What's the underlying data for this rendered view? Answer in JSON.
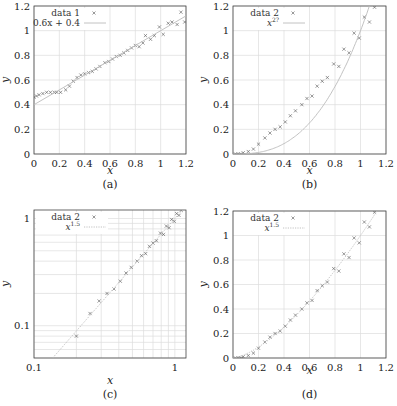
{
  "chart_data": [
    {
      "id": "a",
      "type": "scatter",
      "caption": "(a)",
      "xlabel": "x",
      "ylabel": "y",
      "xlim": [
        0,
        1.2
      ],
      "ylim": [
        0,
        1.2
      ],
      "xticks": [
        "0",
        "0.2",
        "0.4",
        "0.6",
        "0.8",
        "1",
        "1.2"
      ],
      "yticks": [
        "0",
        "0.2",
        "0.4",
        "0.6",
        "0.8",
        "1",
        "1.2"
      ],
      "grid": true,
      "legend_position": "upper left",
      "series": [
        {
          "name": "data 1",
          "marker": "x",
          "x": [
            0,
            0.02,
            0.04,
            0.07,
            0.1,
            0.13,
            0.16,
            0.18,
            0.21,
            0.25,
            0.28,
            0.31,
            0.34,
            0.37,
            0.4,
            0.43,
            0.46,
            0.49,
            0.52,
            0.56,
            0.59,
            0.62,
            0.65,
            0.68,
            0.71,
            0.74,
            0.77,
            0.8,
            0.83,
            0.86,
            0.88,
            0.92,
            0.95,
            0.99,
            1.02,
            1.06,
            1.09,
            1.13,
            1.16,
            1.19
          ],
          "y": [
            0.46,
            0.47,
            0.48,
            0.49,
            0.5,
            0.5,
            0.5,
            0.5,
            0.5,
            0.52,
            0.55,
            0.59,
            0.62,
            0.64,
            0.65,
            0.66,
            0.67,
            0.69,
            0.71,
            0.74,
            0.75,
            0.77,
            0.79,
            0.8,
            0.82,
            0.84,
            0.86,
            0.88,
            0.87,
            0.9,
            0.96,
            0.93,
            0.96,
            1.03,
            0.97,
            1.06,
            1.07,
            1.05,
            1.15,
            1.07
          ]
        },
        {
          "name": "0.6x + 0.4",
          "type": "line",
          "style": "solid",
          "x": [
            0,
            1.2
          ],
          "y": [
            0.4,
            1.12
          ]
        }
      ]
    },
    {
      "id": "b",
      "type": "scatter",
      "caption": "(b)",
      "xlabel": "x",
      "ylabel": "y",
      "xlim": [
        0,
        1.2
      ],
      "ylim": [
        0,
        1.2
      ],
      "xticks": [
        "0",
        "0.2",
        "0.4",
        "0.6",
        "0.8",
        "1",
        "1.2"
      ],
      "yticks": [
        "0",
        "0.2",
        "0.4",
        "0.6",
        "0.8",
        "1",
        "1.2"
      ],
      "grid": true,
      "legend_position": "upper left",
      "series": [
        {
          "name": "data 2",
          "marker": "x",
          "x": [
            0.02,
            0.04,
            0.06,
            0.08,
            0.12,
            0.16,
            0.2,
            0.25,
            0.29,
            0.33,
            0.37,
            0.41,
            0.45,
            0.49,
            0.54,
            0.58,
            0.62,
            0.66,
            0.7,
            0.74,
            0.79,
            0.83,
            0.87,
            0.91,
            0.95,
            0.99,
            1.03,
            1.07,
            1.11
          ],
          "y": [
            0,
            0,
            0,
            0.01,
            0.02,
            0.04,
            0.08,
            0.13,
            0.17,
            0.2,
            0.22,
            0.26,
            0.31,
            0.35,
            0.4,
            0.45,
            0.47,
            0.55,
            0.59,
            0.62,
            0.73,
            0.71,
            0.85,
            0.82,
            0.98,
            0.94,
            1.11,
            1.07,
            1.19
          ]
        },
        {
          "name": "x^2?",
          "type": "line",
          "style": "solid",
          "exponent": 2.7
        }
      ]
    },
    {
      "id": "c",
      "type": "scatter",
      "caption": "(c)",
      "xlabel": "x",
      "ylabel": "y",
      "xscale": "log",
      "yscale": "log",
      "xlim": [
        0.1,
        1.2
      ],
      "ylim": [
        0.05,
        1.2
      ],
      "xticks": [
        "0.1",
        "1"
      ],
      "yticks": [
        "0.1",
        "1"
      ],
      "grid": true,
      "legend_position": "upper left",
      "series": [
        {
          "name": "data 2",
          "marker": "x",
          "ref": "b"
        },
        {
          "name": "x^1.5",
          "type": "line",
          "style": "dotted",
          "exponent": 1.5
        }
      ]
    },
    {
      "id": "d",
      "type": "scatter",
      "caption": "(d)",
      "xlabel": "x",
      "ylabel": "y",
      "xlim": [
        0,
        1.2
      ],
      "ylim": [
        0,
        1.2
      ],
      "xticks": [
        "0",
        "0.2",
        "0.4",
        "0.6",
        "0.8",
        "1",
        "1.2"
      ],
      "yticks": [
        "0",
        "0.2",
        "0.4",
        "0.6",
        "0.8",
        "1",
        "1.2"
      ],
      "grid": true,
      "legend_position": "upper left",
      "series": [
        {
          "name": "data 2",
          "marker": "x",
          "ref": "b"
        },
        {
          "name": "x^1.5",
          "type": "line",
          "style": "dotted",
          "exponent": 1.5
        }
      ]
    }
  ],
  "colors": {
    "axis": "#444444",
    "grid": "#dddddd",
    "marker": "#555555",
    "line": "#bbbbbb"
  }
}
